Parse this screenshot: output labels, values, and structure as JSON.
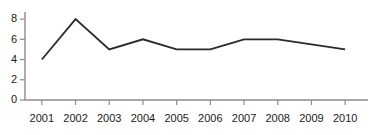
{
  "chart_data": {
    "type": "line",
    "title": "",
    "subtitle": "",
    "xlabel": "",
    "ylabel": "",
    "categories": [
      "2001",
      "2002",
      "2003",
      "2004",
      "2005",
      "2006",
      "2007",
      "2008",
      "2009",
      "2010"
    ],
    "x": [
      2001,
      2002,
      2003,
      2004,
      2005,
      2006,
      2007,
      2008,
      2009,
      2010
    ],
    "values": [
      4,
      8,
      5,
      6,
      5,
      5,
      6,
      6,
      5.5,
      5
    ],
    "series": [
      {
        "name": "",
        "values": [
          4,
          8,
          5,
          6,
          5,
          5,
          6,
          6,
          5.5,
          5
        ],
        "color": "#2b2b2b"
      }
    ],
    "yticks": [
      0,
      2,
      4,
      6,
      8
    ],
    "ytick_labels": [
      "0",
      "2",
      "4",
      "6",
      "8"
    ],
    "xtick_labels": [
      "2001",
      "2002",
      "2003",
      "2004",
      "2005",
      "2006",
      "2007",
      "2008",
      "2009",
      "2010"
    ],
    "ylim": [
      0,
      8.6
    ],
    "xlim": [
      2000.6,
      2010.6
    ],
    "grid": false,
    "legend": false,
    "legend_position": "none",
    "annotations": []
  },
  "style": {
    "line_color": "#2b2b2b",
    "axis_color": "#8c8c8c",
    "text_color": "#1a1a1a",
    "background": "#ffffff"
  },
  "geometry": {
    "plot_left": 25,
    "plot_right": 362,
    "plot_top": 13,
    "plot_bottom": 100,
    "tick_length": 5,
    "xtick_label_y": 114
  }
}
